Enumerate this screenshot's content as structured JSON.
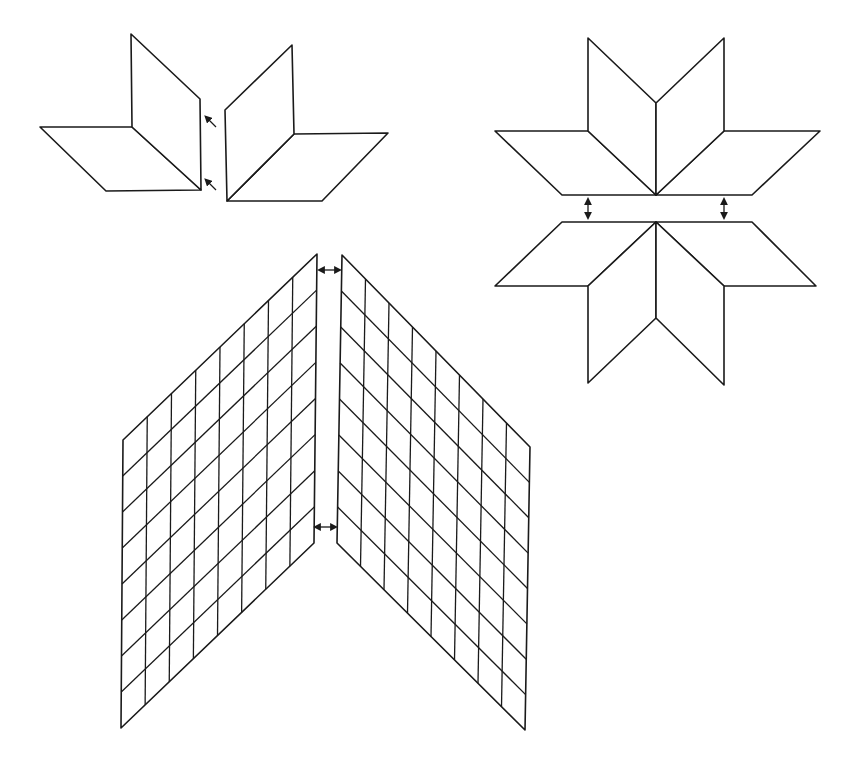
{
  "stroke_color": "#1a1a1a",
  "background_color": "#ffffff",
  "panels": [
    {
      "id": "diamond-pairs-joining",
      "description": "Two pairs of diamonds joined along a seam",
      "pieces": 4,
      "arrow_type": "diagonal"
    },
    {
      "id": "star-halves-joining",
      "description": "Two star halves of four diamonds each joined across the center",
      "pieces": 8,
      "arrow_type": "vertical-double"
    },
    {
      "id": "strip-grid-joining",
      "description": "Two diamond grids joined along the center seam",
      "grid_columns": 8,
      "grid_rows": 8,
      "arrow_type": "horizontal-double"
    }
  ]
}
